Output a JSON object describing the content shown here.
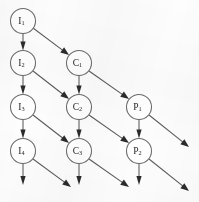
{
  "diagram": {
    "type": "directed-lattice-graph",
    "title": "",
    "canvas": {
      "width": 199,
      "height": 202,
      "background": "#fdfdfd"
    },
    "style": {
      "node_fill": "#ffffff",
      "node_stroke": "#6a6a6a",
      "edge_stroke": "#5a5a5a",
      "arrowhead_fill": "#2b2b2b",
      "label_color": "#1f1f1f",
      "node_radius": 12.5
    },
    "nodes": [
      {
        "id": "I1",
        "base": "I",
        "sub": "1",
        "x": 23,
        "y": 21
      },
      {
        "id": "I2",
        "base": "I",
        "sub": "2",
        "x": 23,
        "y": 63
      },
      {
        "id": "I3",
        "base": "I",
        "sub": "3",
        "x": 23,
        "y": 107
      },
      {
        "id": "I4",
        "base": "I",
        "sub": "4",
        "x": 23,
        "y": 151
      },
      {
        "id": "C1",
        "base": "C",
        "sub": "1",
        "x": 79,
        "y": 63
      },
      {
        "id": "C2",
        "base": "C",
        "sub": "2",
        "x": 79,
        "y": 107
      },
      {
        "id": "C3",
        "base": "C",
        "sub": "3",
        "x": 79,
        "y": 151
      },
      {
        "id": "P1",
        "base": "P",
        "sub": "1",
        "x": 139,
        "y": 107
      },
      {
        "id": "P2",
        "base": "P",
        "sub": "2",
        "x": 139,
        "y": 151
      }
    ],
    "edges": [
      {
        "from": "I1",
        "to": "I2",
        "kind": "vertical",
        "x1": 23,
        "y1": 33.5,
        "x2": 23,
        "y2": 50.5
      },
      {
        "from": "I2",
        "to": "I3",
        "kind": "vertical",
        "x1": 23,
        "y1": 75.5,
        "x2": 23,
        "y2": 94.5
      },
      {
        "from": "I3",
        "to": "I4",
        "kind": "vertical",
        "x1": 23,
        "y1": 119.5,
        "x2": 23,
        "y2": 138.5
      },
      {
        "from": "I4",
        "to": "",
        "kind": "vertical",
        "x1": 23,
        "y1": 163.5,
        "x2": 23,
        "y2": 185
      },
      {
        "from": "C1",
        "to": "C2",
        "kind": "vertical",
        "x1": 79,
        "y1": 75.5,
        "x2": 79,
        "y2": 94.5
      },
      {
        "from": "C2",
        "to": "C3",
        "kind": "vertical",
        "x1": 79,
        "y1": 119.5,
        "x2": 79,
        "y2": 138.5
      },
      {
        "from": "C3",
        "to": "",
        "kind": "vertical",
        "x1": 79,
        "y1": 163.5,
        "x2": 79,
        "y2": 185
      },
      {
        "from": "P1",
        "to": "P2",
        "kind": "vertical",
        "x1": 139,
        "y1": 119.5,
        "x2": 139,
        "y2": 138.5
      },
      {
        "from": "P2",
        "to": "",
        "kind": "vertical",
        "x1": 139,
        "y1": 163.5,
        "x2": 139,
        "y2": 185
      },
      {
        "from": "I1",
        "to": "C1",
        "kind": "diagonal",
        "x1": 33,
        "y1": 28,
        "x2": 69,
        "y2": 55
      },
      {
        "from": "I2",
        "to": "C2",
        "kind": "diagonal",
        "x1": 33,
        "y1": 71,
        "x2": 69,
        "y2": 99
      },
      {
        "from": "I3",
        "to": "C3",
        "kind": "diagonal",
        "x1": 33,
        "y1": 115,
        "x2": 69,
        "y2": 143
      },
      {
        "from": "I4",
        "to": "",
        "kind": "diagonal",
        "x1": 33,
        "y1": 159,
        "x2": 71,
        "y2": 187
      },
      {
        "from": "C1",
        "to": "P1",
        "kind": "diagonal",
        "x1": 89,
        "y1": 71,
        "x2": 129,
        "y2": 99
      },
      {
        "from": "C2",
        "to": "P2",
        "kind": "diagonal",
        "x1": 89,
        "y1": 115,
        "x2": 129,
        "y2": 143
      },
      {
        "from": "C3",
        "to": "",
        "kind": "diagonal",
        "x1": 89,
        "y1": 159,
        "x2": 129,
        "y2": 187
      },
      {
        "from": "P1",
        "to": "",
        "kind": "diagonal",
        "x1": 149,
        "y1": 115,
        "x2": 189,
        "y2": 147
      },
      {
        "from": "P2",
        "to": "",
        "kind": "diagonal",
        "x1": 149,
        "y1": 159,
        "x2": 189,
        "y2": 191
      }
    ]
  }
}
